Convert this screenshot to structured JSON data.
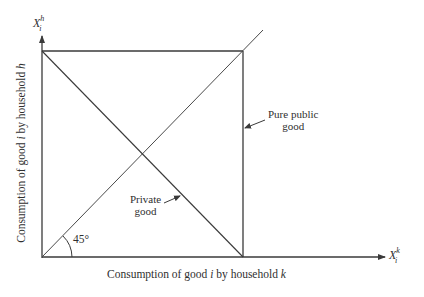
{
  "diagram": {
    "type": "economics-consumption-box",
    "y_axis": {
      "variable": "X",
      "subscript": "i",
      "superscript": "h",
      "label_pre": "Consumption of good ",
      "label_var": "i",
      "label_mid": " by household ",
      "label_hh": "h"
    },
    "x_axis": {
      "variable": "X",
      "subscript": "i",
      "superscript": "k",
      "label_pre": "Consumption of good ",
      "label_var": "i",
      "label_mid": " by household ",
      "label_hh": "k"
    },
    "annotations": {
      "angle": "45°",
      "private_good_line1": "Private",
      "private_good_line2": "good",
      "public_good_line1": "Pure public",
      "public_good_line2": "good"
    },
    "elements": [
      {
        "name": "box",
        "description": "Square with corners at origin, (max,0), (max,max), (0,max)"
      },
      {
        "name": "diagonal-45",
        "description": "45-degree line from origin extending beyond top-right corner"
      },
      {
        "name": "anti-diagonal",
        "description": "Line from top-left to bottom-right corner: private good possibilities"
      },
      {
        "name": "right-edge",
        "description": "Vertical right edge of box: pure public good"
      }
    ],
    "colors": {
      "line": "#3a3a3a",
      "text": "#2f2f2f",
      "background": "#ffffff"
    }
  }
}
